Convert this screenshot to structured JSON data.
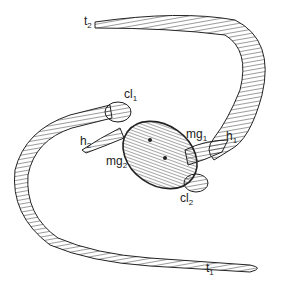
{
  "labels": {
    "t2": {
      "main": "t",
      "sub": "2"
    },
    "cl1": {
      "main": "cl",
      "sub": "1"
    },
    "mg1": {
      "main": "mg",
      "sub": "1"
    },
    "h2": {
      "main": "h",
      "sub": "2"
    },
    "mg2": {
      "main": "mg",
      "sub": "2"
    },
    "h1": {
      "main": "h",
      "sub": "1"
    },
    "cl2": {
      "main": "cl",
      "sub": "2"
    },
    "t1": {
      "main": "t",
      "sub": "1"
    }
  },
  "colors": {
    "stroke": "#222222",
    "background": "#ffffff"
  }
}
